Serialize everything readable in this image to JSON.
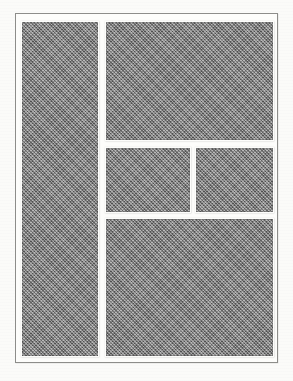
{
  "document": {
    "title": "Page Layout Grid Diagram",
    "description": "Modular page layout wireframe with five shaded content blocks inside a rectangular page frame",
    "medium": "scanned halftone print"
  },
  "colors": {
    "page_background": "#fbfbf9",
    "frame_fill": "#fdfdfb",
    "frame_border": "#8d8d8a",
    "block_fill": "#7e7e7e",
    "gutter": "#fdfdfb"
  },
  "frame": {
    "name": "page-frame",
    "x": 15,
    "y": 13,
    "width": 263,
    "height": 350,
    "border_width": 1
  },
  "layout": {
    "columns": 2,
    "gutter_px": 8,
    "margin_px": 6,
    "blocks": [
      {
        "id": "left-column",
        "label": "Left Column",
        "role": "full-height sidebar column",
        "x": 6,
        "y": 8,
        "width": 76,
        "height": 334
      },
      {
        "id": "top-right",
        "label": "Top Right Block",
        "role": "wide lead content block",
        "x": 90,
        "y": 8,
        "width": 167,
        "height": 118
      },
      {
        "id": "mid-left",
        "label": "Middle Left Block",
        "role": "half-width secondary block",
        "x": 90,
        "y": 134,
        "width": 84,
        "height": 64
      },
      {
        "id": "mid-right",
        "label": "Middle Right Block",
        "role": "half-width secondary block",
        "x": 180,
        "y": 134,
        "width": 77,
        "height": 64
      },
      {
        "id": "bottom-right",
        "label": "Bottom Right Block",
        "role": "wide closing content block",
        "x": 90,
        "y": 205,
        "width": 167,
        "height": 137
      }
    ]
  }
}
